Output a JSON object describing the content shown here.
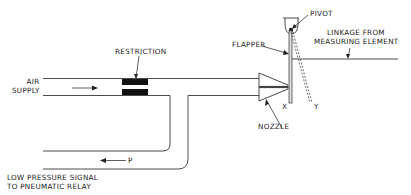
{
  "labels": {
    "restriction": "RESTRICTION",
    "air_supply_line1": "AIR",
    "air_supply_line2": "SUPPLY",
    "pivot": "PIVOT",
    "flapper": "FLAPPER",
    "linkage_line1": "LINKAGE FROM",
    "linkage_line2": "MEASURING ELEMENT",
    "nozzle": "NOZZLE",
    "x": "X",
    "y": "Y",
    "p": "P",
    "signal_line1": "LOW PRESSURE SIGNAL",
    "signal_line2": "TO PNEUMATIC RELAY"
  },
  "colors": {
    "line": "#4a4a4a",
    "fill": "#111111",
    "background": "#ffffff"
  }
}
